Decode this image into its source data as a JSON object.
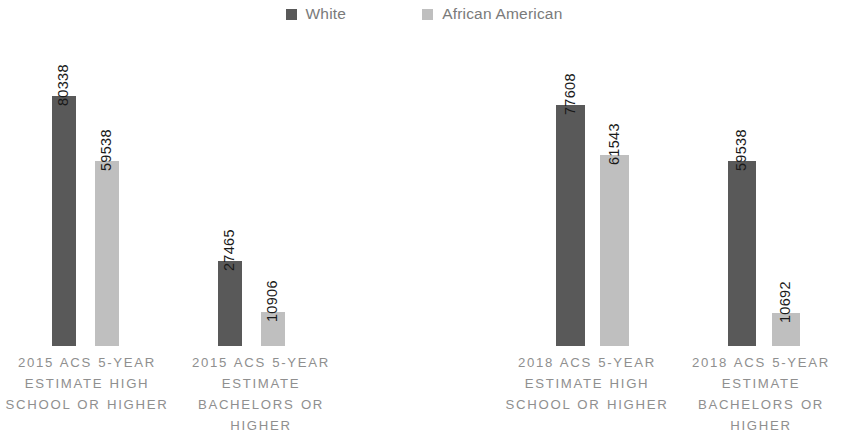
{
  "legend": {
    "position": "top-center",
    "items": [
      {
        "label": "White",
        "color": "#595959",
        "icon": "square-swatch"
      },
      {
        "label": "African American",
        "color": "#BFBFBF",
        "icon": "square-swatch"
      }
    ]
  },
  "chart_data": {
    "type": "bar",
    "title": "",
    "subtitle": "",
    "xlabel": "",
    "ylabel": "",
    "grid": false,
    "legend_position": "top-center",
    "ylim": [
      0,
      85000
    ],
    "categories": [
      "2015 ACS 5-YEAR ESTIMATE HIGH SCHOOL OR HIGHER",
      "2015 ACS 5-YEAR ESTIMATE BACHELORS OR HIGHER",
      "2018 ACS 5-YEAR ESTIMATE HIGH SCHOOL OR HIGHER",
      "2018 ACS 5-YEAR ESTIMATE BACHELORS OR HIGHER"
    ],
    "series": [
      {
        "name": "White",
        "color": "#595959",
        "values": [
          80338,
          27465,
          77608,
          59538
        ]
      },
      {
        "name": "African American",
        "color": "#BFBFBF",
        "values": [
          59538,
          10906,
          61543,
          10692
        ]
      }
    ],
    "data_labels": [
      [
        "80338",
        "59538"
      ],
      [
        "27465",
        "10906"
      ],
      [
        "77608",
        "61543"
      ],
      [
        "59538",
        "10692"
      ]
    ]
  },
  "bars": [
    {
      "value_label": "80338",
      "value": 80338,
      "series": "White",
      "color": "#595959",
      "x": 52,
      "w": 24,
      "h": 250
    },
    {
      "value_label": "59538",
      "value": 59538,
      "series": "African American",
      "color": "#BFBFBF",
      "x": 95,
      "w": 24,
      "h": 185
    },
    {
      "value_label": "27465",
      "value": 27465,
      "series": "White",
      "color": "#595959",
      "x": 218,
      "w": 24,
      "h": 85
    },
    {
      "value_label": "10906",
      "value": 10906,
      "series": "African American",
      "color": "#BFBFBF",
      "x": 261,
      "w": 24,
      "h": 34
    },
    {
      "value_label": "77608",
      "value": 77608,
      "series": "White",
      "color": "#595959",
      "x": 556,
      "w": 29,
      "h": 241
    },
    {
      "value_label": "61543",
      "value": 61543,
      "series": "African American",
      "color": "#BFBFBF",
      "x": 600,
      "w": 29,
      "h": 191
    },
    {
      "value_label": "59538",
      "value": 59538,
      "series": "White",
      "color": "#595959",
      "x": 728,
      "w": 28,
      "h": 185
    },
    {
      "value_label": "10692",
      "value": 10692,
      "series": "African American",
      "color": "#BFBFBF",
      "x": 772,
      "w": 28,
      "h": 33
    }
  ],
  "category_labels": [
    {
      "text": "2015 ACS 5-YEAR ESTIMATE HIGH SCHOOL OR HIGHER",
      "left": 0,
      "width": 174
    },
    {
      "text": "2015 ACS 5-YEAR ESTIMATE BACHELORS OR HIGHER",
      "left": 174,
      "width": 174
    },
    {
      "text": "2018 ACS 5-YEAR ESTIMATE HIGH SCHOOL OR HIGHER",
      "left": 500,
      "width": 174
    },
    {
      "text": "2018 ACS 5-YEAR ESTIMATE BACHELORS OR HIGHER",
      "left": 674,
      "width": 174
    }
  ]
}
